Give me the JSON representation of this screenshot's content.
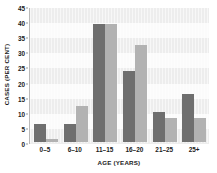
{
  "chart_data": {
    "type": "bar",
    "title": "",
    "xlabel": "AGE (YEARS)",
    "ylabel": "CASES (PER CENT)",
    "categories": [
      "0–5",
      "6–10",
      "11–15",
      "16–20",
      "21–25",
      "25+"
    ],
    "series": [
      {
        "name": "series-1",
        "color": "#6f6f6f",
        "values": [
          6,
          6,
          39,
          23.5,
          10,
          16
        ]
      },
      {
        "name": "series-2",
        "color": "#b2b2b2",
        "values": [
          1,
          12,
          39,
          32,
          8,
          8
        ]
      }
    ],
    "ylim": [
      0,
      45
    ],
    "ytick_labels": [
      "0",
      "5",
      "10",
      "15",
      "20",
      "25",
      "30",
      "35",
      "40",
      "45"
    ],
    "ytick_values": [
      0,
      5,
      10,
      15,
      20,
      25,
      30,
      35,
      40,
      45
    ],
    "grid": "horizontal-bands",
    "legend": "none"
  }
}
